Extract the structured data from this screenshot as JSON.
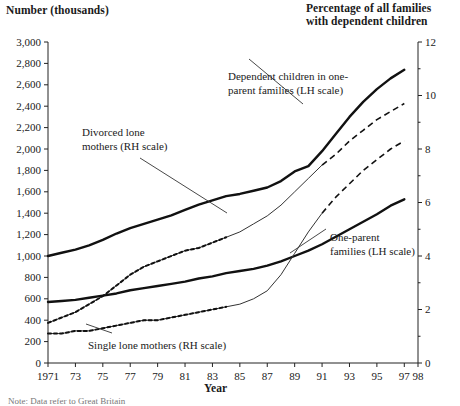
{
  "left_axis_title": "Number (thousands)",
  "right_axis_title_l1": "Percentage of all families",
  "right_axis_title_l2": "with dependent children",
  "x_axis_title": "Year",
  "footnote": "Note: Data refer to Great Britain",
  "annotations": {
    "dependent_children_l1": "Dependent children in one-",
    "dependent_children_l2": "parent families (LH scale)",
    "divorced_l1": "Divorced lone",
    "divorced_l2": "mothers (RH scale)",
    "single_lone": "Single lone mothers (RH scale)",
    "one_parent_l1": "One-parent",
    "one_parent_l2": "families (LH scale)"
  },
  "chart_data": {
    "type": "line",
    "title": "",
    "xlabel": "Year",
    "ylabel": "Number (thousands)",
    "y2label": "Percentage of all families with dependent children",
    "xlim": [
      1971,
      1998
    ],
    "ylim": [
      0,
      3000
    ],
    "y2lim": [
      0,
      12
    ],
    "grid": false,
    "legend": "annotations-inline",
    "xticks": [
      1971,
      1973,
      1975,
      1977,
      1979,
      1981,
      1983,
      1985,
      1987,
      1989,
      1991,
      1993,
      1995,
      1997,
      1998
    ],
    "xticklabels": [
      "1971",
      "73",
      "75",
      "77",
      "79",
      "81",
      "83",
      "85",
      "87",
      "89",
      "91",
      "93",
      "95",
      "97",
      "98"
    ],
    "yticks": [
      0,
      200,
      400,
      600,
      800,
      1000,
      1200,
      1400,
      1600,
      1800,
      2000,
      2200,
      2400,
      2600,
      2800,
      3000
    ],
    "yticklabels": [
      "0",
      "200",
      "400",
      "600",
      "800",
      "1,000",
      "1,200",
      "1,400",
      "1,600",
      "1,800",
      "2,000",
      "2,200",
      "2,400",
      "2,600",
      "2,800",
      "3,000"
    ],
    "y2ticks": [
      0,
      2,
      4,
      6,
      8,
      10,
      12
    ],
    "y2ticklabels": [
      "0",
      "2",
      "4",
      "6",
      "8",
      "10",
      "12"
    ],
    "y2minorticks": [
      1,
      3,
      5,
      7,
      9,
      11
    ],
    "x": [
      1971,
      1972,
      1973,
      1974,
      1975,
      1976,
      1977,
      1978,
      1979,
      1980,
      1981,
      1982,
      1983,
      1984,
      1985,
      1986,
      1987,
      1988,
      1989,
      1990,
      1991,
      1992,
      1993,
      1994,
      1995,
      1996,
      1997
    ],
    "series": [
      {
        "name": "Dependent children in one-parent families (LH scale)",
        "axis": "left",
        "style": "solid-bold",
        "units": "thousands",
        "values": [
          1000,
          1030,
          1060,
          1100,
          1150,
          1210,
          1260,
          1300,
          1340,
          1380,
          1430,
          1480,
          1520,
          1560,
          1580,
          1610,
          1640,
          1700,
          1790,
          1840,
          1980,
          2140,
          2300,
          2440,
          2560,
          2660,
          2740
        ]
      },
      {
        "name": "One-parent families (LH scale)",
        "axis": "left",
        "style": "solid-bold",
        "units": "thousands",
        "values": [
          570,
          580,
          590,
          610,
          630,
          650,
          680,
          700,
          720,
          740,
          760,
          790,
          810,
          840,
          860,
          880,
          910,
          950,
          1000,
          1050,
          1110,
          1180,
          1250,
          1320,
          1390,
          1470,
          1530
        ]
      },
      {
        "name": "Divorced lone mothers (RH scale)",
        "axis": "right",
        "style": "solid-thin-then-dashed",
        "units": "percent",
        "values": [
          1.5,
          1.7,
          1.9,
          2.2,
          2.5,
          2.9,
          3.3,
          3.6,
          3.8,
          4.0,
          4.2,
          4.3,
          4.5,
          4.7,
          4.9,
          5.2,
          5.5,
          5.9,
          6.4,
          6.9,
          7.4,
          7.8,
          8.3,
          8.7,
          9.1,
          9.4,
          9.7
        ]
      },
      {
        "name": "Single lone mothers (RH scale)",
        "axis": "right",
        "style": "solid-thin-then-dashed",
        "units": "percent",
        "values": [
          1.1,
          1.1,
          1.2,
          1.2,
          1.3,
          1.4,
          1.5,
          1.6,
          1.6,
          1.7,
          1.8,
          1.9,
          2.0,
          2.1,
          2.2,
          2.4,
          2.7,
          3.3,
          4.1,
          4.9,
          5.6,
          6.2,
          6.7,
          7.2,
          7.6,
          8.0,
          8.3
        ]
      }
    ]
  }
}
